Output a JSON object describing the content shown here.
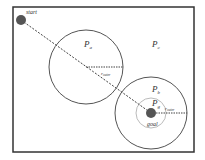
{
  "diagram": {
    "title": "",
    "labels": {
      "start": "start",
      "goal": "goal",
      "region_a": "P",
      "region_a_sub": "a",
      "region_c": "P",
      "region_c_sub": "c",
      "region_b": "P",
      "region_b_sub": "b",
      "region_g": "P",
      "region_g_sub": "g",
      "radius_a": "r",
      "radius_a_sub": "outer",
      "radius_b": "r",
      "radius_b_sub": "outer"
    },
    "colors": {
      "border": "#333333",
      "circle": "#555555",
      "point": "#555555",
      "path": "#444444",
      "inner_circle": "#bbbbbb"
    }
  }
}
